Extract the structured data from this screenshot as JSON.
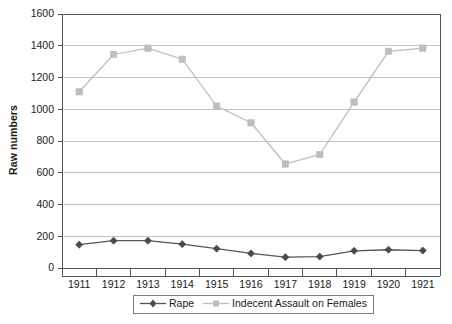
{
  "chart_data": {
    "type": "line",
    "title": "",
    "xlabel": "",
    "ylabel": "Raw numbers",
    "ylim": [
      0,
      1600
    ],
    "ytick_step": 200,
    "yticks": [
      "0",
      "200",
      "400",
      "600",
      "800",
      "1000",
      "1200",
      "1400",
      "1600"
    ],
    "grid": true,
    "legend_position": "bottom",
    "categories": [
      "1911",
      "1912",
      "1913",
      "1914",
      "1915",
      "1916",
      "1917",
      "1918",
      "1919",
      "1920",
      "1921"
    ],
    "series": [
      {
        "name": "Rape",
        "color": "#555555",
        "marker": "diamond",
        "values": [
          147,
          172,
          172,
          150,
          122,
          92,
          68,
          72,
          108,
          115,
          110
        ]
      },
      {
        "name": "Indecent Assault on Females",
        "color": "#bdbdbd",
        "marker": "square",
        "values": [
          1110,
          1345,
          1385,
          1315,
          1020,
          915,
          655,
          715,
          1045,
          1365,
          1385
        ]
      }
    ]
  },
  "legend": {
    "items": [
      {
        "label": "Rape",
        "marker": "diamond-marker-icon"
      },
      {
        "label": "Indecent Assault on Females",
        "marker": "square-marker-icon"
      }
    ]
  },
  "axes": {
    "y_title": "Raw numbers"
  }
}
